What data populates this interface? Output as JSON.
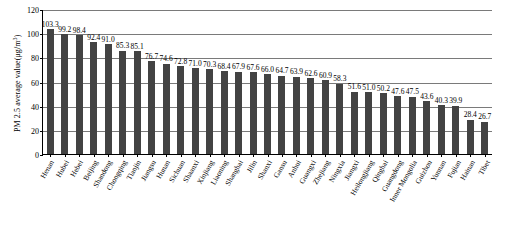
{
  "chart_data": {
    "type": "bar",
    "title": "",
    "xlabel": "",
    "ylabel": "PM 2.5 average value(μg/m³)",
    "ylabel_main": "PM 2.5 average value(μg/m",
    "ylabel_sup": "3",
    "ylabel_tail": ")",
    "ylim": [
      0,
      120
    ],
    "yticks": [
      0,
      20,
      40,
      60,
      80,
      100,
      120
    ],
    "ytick_labels": [
      "0",
      "20",
      "40",
      "60",
      "80",
      "100",
      "120"
    ],
    "grid": true,
    "legend": "none",
    "bar_color": "#434343",
    "categories": [
      "Henan",
      "Hubei",
      "Hebei",
      "Beijing",
      "Shandong",
      "Chongqing",
      "Tianjin",
      "Jiangsu",
      "Hunan",
      "Sichuan",
      "Shaanxi",
      "Xinjiang",
      "Liaoning",
      "Shanghai",
      "Jilin",
      "Shanxi",
      "Gansu",
      "Anhui",
      "Guangxi",
      "Zhejiang",
      "Ningxia",
      "Jiangxi",
      "Heilongjiang",
      "Qinghai",
      "Guangdong",
      "Inner Mongolia",
      "Guizhou",
      "Yunnan",
      "Fujian",
      "Hainan",
      "Tibet"
    ],
    "values": [
      103.3,
      99.2,
      98.4,
      92.4,
      91.0,
      85.3,
      85.1,
      76.7,
      74.6,
      72.8,
      71.0,
      70.3,
      68.4,
      67.9,
      67.6,
      66.0,
      64.7,
      63.9,
      62.6,
      60.9,
      58.3,
      51.6,
      51.0,
      50.2,
      47.6,
      47.5,
      43.6,
      40.3,
      39.9,
      28.4,
      26.7
    ],
    "value_labels": [
      "103.3",
      "99.2",
      "98.4",
      "92.4",
      "91.0",
      "85.3",
      "85.1",
      "76.7",
      "74.6",
      "72.8",
      "71.0",
      "70.3",
      "68.4",
      "67.9",
      "67.6",
      "66.0",
      "64.7",
      "63.9",
      "62.6",
      "60.9",
      "58.3",
      "51.6",
      "51.0",
      "50.2",
      "47.6",
      "47.5",
      "43.6",
      "40.3",
      "39.9",
      "28.4",
      "26.7"
    ]
  }
}
